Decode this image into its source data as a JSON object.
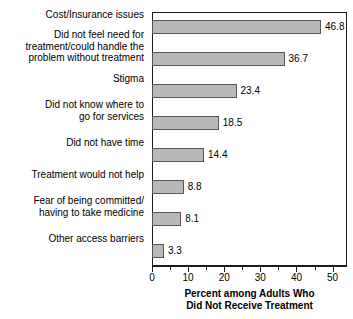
{
  "chart_data": {
    "type": "bar",
    "orientation": "horizontal",
    "title": "",
    "xlabel": "Percent among Adults Who\nDid Not Receive Treatment",
    "ylabel": "",
    "xlim": [
      0,
      54
    ],
    "xticks": [
      0,
      10,
      20,
      30,
      40,
      50
    ],
    "xtick_labels": [
      "0",
      "10",
      "20",
      "30",
      "40",
      "50"
    ],
    "minor_tick_step": 5,
    "grid": false,
    "legend": null,
    "bar_color": "#b9b9b9",
    "bar_edge_color": "#555555",
    "frame_color": "#1a1a1a",
    "categories": [
      "Cost/Insurance issues",
      "Did not feel need for\ntreatment/could handle the\nproblem without treatment",
      "Stigma",
      "Did not know where to\ngo for services",
      "Did not have time",
      "Treatment would not help",
      "Fear of being committed/\nhaving to take medicine",
      "Other access barriers"
    ],
    "values": [
      46.8,
      36.7,
      23.4,
      18.5,
      14.4,
      8.8,
      8.1,
      3.3
    ],
    "value_labels": [
      "46.8",
      "36.7",
      "23.4",
      "18.5",
      "14.4",
      "8.8",
      "8.1",
      "3.3"
    ],
    "bars": [
      {
        "label": "Cost/Insurance issues",
        "value": 46.8,
        "value_label": "46.8",
        "top": 8,
        "label_top": 9
      },
      {
        "label": "Did not feel need for\ntreatment/could handle the\nproblem without treatment",
        "value": 36.7,
        "value_label": "36.7",
        "top": 40,
        "label_top": 29
      },
      {
        "label": "Stigma",
        "value": 23.4,
        "value_label": "23.4",
        "top": 72,
        "label_top": 73
      },
      {
        "label": "Did not know where to\ngo for services",
        "value": 18.5,
        "value_label": "18.5",
        "top": 104,
        "label_top": 99
      },
      {
        "label": "Did not have time",
        "value": 14.4,
        "value_label": "14.4",
        "top": 136,
        "label_top": 137
      },
      {
        "label": "Treatment would not help",
        "value": 8.8,
        "value_label": "8.8",
        "top": 168,
        "label_top": 169
      },
      {
        "label": "Fear of being committed/\nhaving to take medicine",
        "value": 8.1,
        "value_label": "8.1",
        "top": 200,
        "label_top": 195
      },
      {
        "label": "Other access barriers",
        "value": 3.3,
        "value_label": "3.3",
        "top": 232,
        "label_top": 233
      }
    ]
  }
}
